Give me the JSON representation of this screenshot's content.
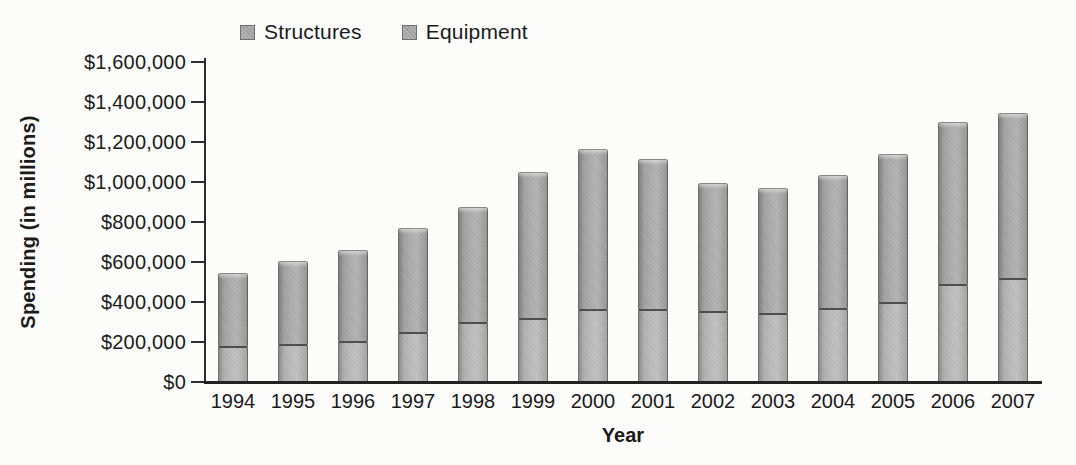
{
  "figure": {
    "background": "#fcfcfb",
    "text_color": "#1b1b1b",
    "axis_color": "#2d2d2d"
  },
  "chart_data": {
    "type": "bar",
    "stacked": true,
    "title": "",
    "xlabel": "Year",
    "ylabel": "Spending (in millions)",
    "ylim": [
      0,
      1600000
    ],
    "ytick_interval": 200000,
    "ytick_labels": [
      "$0",
      "$200,000",
      "$400,000",
      "$600,000",
      "$800,000",
      "$1,000,000",
      "$1,200,000",
      "$1,400,000",
      "$1,600,000"
    ],
    "grid": false,
    "legend_position": "top",
    "categories": [
      "1994",
      "1995",
      "1996",
      "1997",
      "1998",
      "1999",
      "2000",
      "2001",
      "2002",
      "2003",
      "2004",
      "2005",
      "2006",
      "2007"
    ],
    "series": [
      {
        "name": "Structures",
        "color": "#b9b9b9",
        "values": [
          170000,
          180000,
          195000,
          240000,
          290000,
          310000,
          355000,
          355000,
          345000,
          335000,
          360000,
          390000,
          480000,
          510000
        ]
      },
      {
        "name": "Equipment",
        "color": "#a6a6a6",
        "values": [
          375000,
          425000,
          465000,
          530000,
          585000,
          740000,
          810000,
          760000,
          650000,
          635000,
          675000,
          750000,
          820000,
          835000
        ]
      }
    ],
    "totals": [
      545000,
      605000,
      660000,
      770000,
      875000,
      1050000,
      1165000,
      1115000,
      995000,
      970000,
      1035000,
      1140000,
      1300000,
      1345000
    ]
  }
}
